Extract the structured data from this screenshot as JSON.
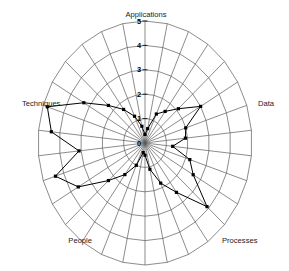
{
  "chart": {
    "type": "radar",
    "title": "",
    "center_x": 145,
    "center_y": 143,
    "radius_x": 107,
    "radius_y": 122,
    "rings": 5,
    "grid": true,
    "legend_position": "none"
  },
  "chart_data": {
    "type": "radar",
    "title": "",
    "subtitle": "",
    "xlabel": "",
    "ylabel": "",
    "grid": true,
    "legend_position": "none",
    "rmin": 0,
    "rmax": 5,
    "tick_labels": [
      "0",
      "1",
      "2",
      "3",
      "4",
      "5"
    ],
    "tick_values": [
      0,
      1,
      2,
      3,
      4,
      5
    ],
    "axis_labels": [
      "Applications",
      "Data",
      "Processes",
      "People",
      "Techniques"
    ],
    "axis_label_positions": [
      {
        "label": "Applications",
        "angle_deg": 90
      },
      {
        "label": "Data",
        "angle_deg": 0
      },
      {
        "label": "Processes",
        "angle_deg": -60
      },
      {
        "label": "People",
        "angle_deg": -120
      },
      {
        "label": "Techniques",
        "angle_deg": 180
      }
    ],
    "n_axes": 30,
    "categories": [
      "A1",
      "A2",
      "A3",
      "A4",
      "A5",
      "A6",
      "A7",
      "A8",
      "A9",
      "A10",
      "A11",
      "A12",
      "A13",
      "A14",
      "A15",
      "A16",
      "A17",
      "A18",
      "A19",
      "A20",
      "A21",
      "A22",
      "A23",
      "A24",
      "A25",
      "A26",
      "A27",
      "A28",
      "A29",
      "A30"
    ],
    "series": [
      {
        "name": "Assessment",
        "values": [
          0.35,
          0.6,
          1.3,
          1.6,
          2.1,
          3.0,
          2.0,
          1.9,
          1.3,
          2.2,
          2.6,
          3.9,
          2.5,
          1.8,
          1.1,
          0.5,
          0.4,
          1.0,
          1.6,
          2.3,
          3.6,
          4.4,
          3.1,
          4.4,
          4.8,
          3.3,
          2.3,
          1.7,
          1.2,
          0.7
        ]
      }
    ]
  }
}
